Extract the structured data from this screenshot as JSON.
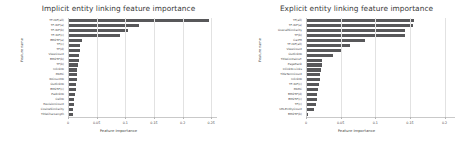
{
  "figure": {
    "width": 475,
    "height": 145,
    "background": "#ffffff",
    "bar_color": "#58585a",
    "grid_color": "#e2e2e2"
  },
  "chart_data": [
    {
      "type": "bar",
      "orientation": "horizontal",
      "title": "Implicit entity linking feature importance",
      "xlabel": "Feature importance",
      "ylabel": "Feature name",
      "xlim": [
        0,
        0.26
      ],
      "xticks": [
        0,
        0.05,
        0.1,
        0.15,
        0.2,
        0.25
      ],
      "xticklabels": [
        "0",
        "0.05",
        "0.1",
        "0.15",
        "0.2",
        "0.25"
      ],
      "grid": true,
      "legend": "none",
      "categories": [
        "TF-IDF(all)",
        "TF-IDF(a)",
        "TF-IDF(b)",
        "TF-IDF(c)",
        "BM25F(a)",
        "TF(c)",
        "TF(d)",
        "ViewCount",
        "BM25F(b)",
        "TF(b)",
        "InlinkID",
        "PAIRC",
        "IDCountID",
        "OutlinkID",
        "BM25F(c)",
        "PadInkID",
        "CellID",
        "RevisionCount",
        "CosineSimilarity",
        "TitleCharLength"
      ],
      "values": [
        0.2465,
        0.1235,
        0.1055,
        0.0905,
        0.025,
        0.0215,
        0.0205,
        0.0195,
        0.019,
        0.018,
        0.0165,
        0.016,
        0.0155,
        0.0145,
        0.0135,
        0.0115,
        0.0105,
        0.01,
        0.0095,
        0.009
      ]
    },
    {
      "type": "bar",
      "orientation": "horizontal",
      "title": "Explicit entity linking feature importance",
      "xlabel": "Feature importance",
      "ylabel": "Feature name",
      "xlim": [
        0,
        0.215
      ],
      "xticks": [
        0,
        0.05,
        0.1,
        0.15,
        0.2
      ],
      "xticklabels": [
        "0",
        "0.05",
        "0.1",
        "0.15",
        "0.2"
      ],
      "grid": true,
      "legend": "none",
      "categories": [
        "TF(all)",
        "TF-IDF(a)",
        "OverallSimilarity",
        "TF(b)",
        "CarPR",
        "TF-IDF(all)",
        "ViewCount",
        "OutlinkID",
        "TitleContainsT.",
        "PageRank",
        "InlinkID-Links",
        "TitleTermCount",
        "InlinkID",
        "TF-IDF(c)",
        "PAIRC",
        "BM25F(d)",
        "BM25F(c)",
        "TF(c)",
        "URLEntityCount",
        "BM25F(b)"
      ],
      "values": [
        0.1565,
        0.155,
        0.143,
        0.1425,
        0.0845,
        0.063,
        0.05,
        0.0395,
        0.023,
        0.0225,
        0.0215,
        0.0205,
        0.0195,
        0.0185,
        0.0175,
        0.0165,
        0.0155,
        0.0145,
        0.011,
        0.0035
      ]
    }
  ]
}
